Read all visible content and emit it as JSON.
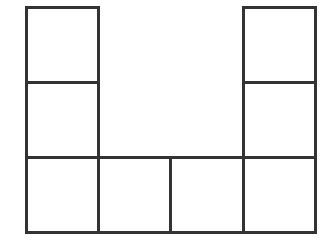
{
  "diagram": {
    "type": "grid-shape",
    "line_color": "#333333",
    "fill_color": "#ffffff",
    "grid": {
      "columns": 4,
      "rows": 3,
      "origin_x": 25,
      "origin_y": 6,
      "cell_width": 72.5,
      "cell_height": 75.7
    },
    "cells": [
      {
        "row": 0,
        "col": 0
      },
      {
        "row": 1,
        "col": 0
      },
      {
        "row": 2,
        "col": 0
      },
      {
        "row": 2,
        "col": 1
      },
      {
        "row": 2,
        "col": 2
      },
      {
        "row": 2,
        "col": 3
      },
      {
        "row": 1,
        "col": 3
      },
      {
        "row": 0,
        "col": 3
      }
    ]
  }
}
